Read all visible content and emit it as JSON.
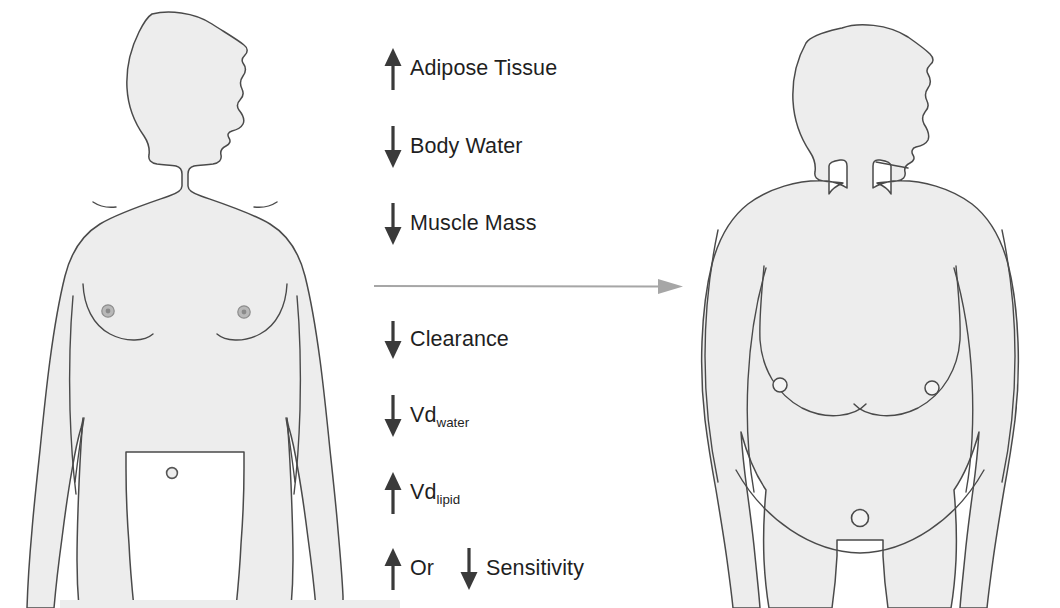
{
  "figure": {
    "left_figure": {
      "name": "lean-male-silhouette",
      "alt": "Lean adult male torso silhouette, front view, head turned to the right"
    },
    "right_figure": {
      "name": "obese-male-silhouette",
      "alt": "Obese adult male torso silhouette, front view, head turned to the right"
    },
    "transition_arrow": {
      "name": "transition-arrow",
      "direction": "right",
      "color": "#a6a6a6"
    },
    "colors": {
      "body_fill": "#ededed",
      "body_outline": "#4a4a4a",
      "text": "#1f1f1f",
      "arrow": "#3a3a3a",
      "transition_arrow": "#a6a6a6",
      "bottom_bar": "#eceded",
      "background": "#ffffff"
    },
    "changes": [
      {
        "id": "adipose",
        "direction": "up",
        "label": "Adipose Tissue",
        "sub": ""
      },
      {
        "id": "body_water",
        "direction": "down",
        "label": "Body Water",
        "sub": ""
      },
      {
        "id": "muscle_mass",
        "direction": "down",
        "label": "Muscle Mass",
        "sub": ""
      },
      {
        "id": "clearance",
        "direction": "down",
        "label": "Clearance",
        "sub": ""
      },
      {
        "id": "vd_water",
        "direction": "down",
        "label": "Vd",
        "sub": "water"
      },
      {
        "id": "vd_lipid",
        "direction": "up",
        "label": "Vd",
        "sub": "lipid"
      },
      {
        "id": "sensitivity",
        "direction": "up",
        "label": "Sensitivity",
        "sub": "",
        "conjunction": "Or",
        "second_direction": "down"
      }
    ],
    "bottom_bar": {
      "name": "bottom-bar"
    }
  }
}
